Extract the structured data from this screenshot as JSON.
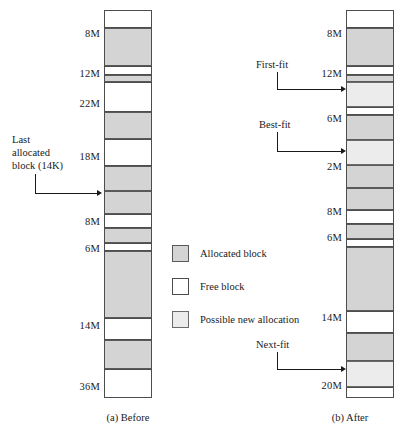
{
  "figure": {
    "type": "memory-allocation-diagram",
    "panels": [
      {
        "id": "before",
        "caption": "(a) Before"
      },
      {
        "id": "after",
        "caption": "(b) After"
      }
    ]
  },
  "colors": {
    "allocated": "#d4d4d4",
    "free": "#ffffff",
    "possible": "#ececec",
    "outline": "#4d4d4d",
    "arrow": "#1a1a1a"
  },
  "legend": {
    "items": [
      {
        "swatch": "allocated",
        "label": "Allocated block"
      },
      {
        "swatch": "free",
        "label": "Free block"
      },
      {
        "swatch": "possible",
        "label": "Possible new allocation"
      }
    ]
  },
  "before": {
    "caption": "(a) Before",
    "size_labels": [
      {
        "text": "8M",
        "top": 18
      },
      {
        "text": "12M",
        "top": 58
      },
      {
        "text": "22M",
        "top": 88
      },
      {
        "text": "18M",
        "top": 141
      },
      {
        "text": "8M",
        "top": 206
      },
      {
        "text": "6M",
        "top": 233
      },
      {
        "text": "14M",
        "top": 310
      },
      {
        "text": "36M",
        "top": 371
      }
    ],
    "blocks": [
      {
        "kind": "free",
        "top": 0,
        "height": 17
      },
      {
        "kind": "alloc",
        "top": 17,
        "height": 38
      },
      {
        "kind": "free",
        "top": 55,
        "height": 9
      },
      {
        "kind": "alloc",
        "top": 64,
        "height": 7
      },
      {
        "kind": "free",
        "top": 71,
        "height": 30
      },
      {
        "kind": "alloc",
        "top": 101,
        "height": 27
      },
      {
        "kind": "free",
        "top": 128,
        "height": 27
      },
      {
        "kind": "alloc",
        "top": 155,
        "height": 25
      },
      {
        "kind": "alloc",
        "top": 180,
        "height": 23
      },
      {
        "kind": "free",
        "top": 203,
        "height": 14
      },
      {
        "kind": "alloc",
        "top": 217,
        "height": 15
      },
      {
        "kind": "free",
        "top": 232,
        "height": 8
      },
      {
        "kind": "alloc",
        "top": 240,
        "height": 67
      },
      {
        "kind": "free",
        "top": 307,
        "height": 22
      },
      {
        "kind": "alloc",
        "top": 329,
        "height": 29
      },
      {
        "kind": "free",
        "top": 358,
        "height": 28
      }
    ],
    "annotation": {
      "label_line1": "Last",
      "label_line2": "allocated",
      "label_line3": "block (14K)"
    }
  },
  "after": {
    "caption": "(b) After",
    "size_labels": [
      {
        "text": "8M",
        "top": 18
      },
      {
        "text": "12M",
        "top": 58
      },
      {
        "text": "6M",
        "top": 103
      },
      {
        "text": "2M",
        "top": 151
      },
      {
        "text": "8M",
        "top": 196
      },
      {
        "text": "6M",
        "top": 222
      },
      {
        "text": "14M",
        "top": 302
      },
      {
        "text": "20M",
        "top": 370
      }
    ],
    "blocks": [
      {
        "kind": "free",
        "top": 0,
        "height": 17
      },
      {
        "kind": "alloc",
        "top": 17,
        "height": 38
      },
      {
        "kind": "free",
        "top": 55,
        "height": 9
      },
      {
        "kind": "alloc",
        "top": 64,
        "height": 7
      },
      {
        "kind": "possible",
        "top": 71,
        "height": 25
      },
      {
        "kind": "free",
        "top": 96,
        "height": 8
      },
      {
        "kind": "alloc",
        "top": 104,
        "height": 25
      },
      {
        "kind": "possible",
        "top": 129,
        "height": 25
      },
      {
        "kind": "alloc",
        "top": 154,
        "height": 23
      },
      {
        "kind": "alloc",
        "top": 177,
        "height": 22
      },
      {
        "kind": "free",
        "top": 199,
        "height": 14
      },
      {
        "kind": "alloc",
        "top": 213,
        "height": 15
      },
      {
        "kind": "free",
        "top": 228,
        "height": 8
      },
      {
        "kind": "alloc",
        "top": 236,
        "height": 64
      },
      {
        "kind": "free",
        "top": 300,
        "height": 22
      },
      {
        "kind": "alloc",
        "top": 322,
        "height": 28
      },
      {
        "kind": "possible",
        "top": 350,
        "height": 26
      },
      {
        "kind": "free",
        "top": 376,
        "height": 10
      }
    ],
    "annotations": [
      {
        "label": "First-fit"
      },
      {
        "label": "Best-fit"
      },
      {
        "label": "Next-fit"
      }
    ]
  }
}
